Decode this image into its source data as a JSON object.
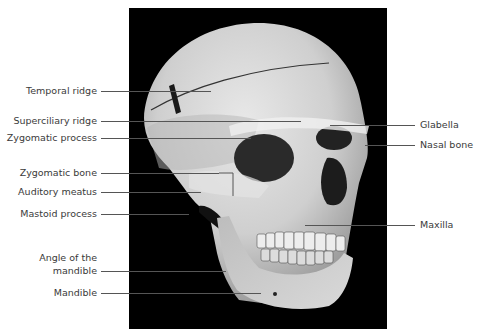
{
  "diagram": {
    "left_labels": [
      {
        "text": "Temporal ridge",
        "y": 91
      },
      {
        "text": "Superciliary ridge",
        "y": 121
      },
      {
        "text": "Zygomatic process",
        "y": 138
      },
      {
        "text": "Zygomatic bone",
        "y": 173
      },
      {
        "text": "Auditory meatus",
        "y": 192
      },
      {
        "text": "Mastoid process",
        "y": 214
      },
      {
        "text_line1": "Angle of the",
        "text_line2": "mandible",
        "y": 271
      },
      {
        "text": "Mandible",
        "y": 293
      }
    ],
    "right_labels": [
      {
        "text": "Glabella",
        "y": 125
      },
      {
        "text": "Nasal bone",
        "y": 145
      },
      {
        "text": "Maxilla",
        "y": 225
      }
    ]
  }
}
